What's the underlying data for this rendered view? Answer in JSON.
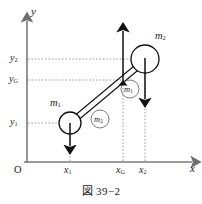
{
  "figure": {
    "caption": "図 39−2",
    "origin_label": "O",
    "axes": {
      "x_name": "x",
      "y_name": "y"
    },
    "x_ticks": [
      {
        "key": "x1",
        "base": "x",
        "sub": "1",
        "px": 70
      },
      {
        "key": "xG",
        "base": "x",
        "sub": "G",
        "px": 123
      },
      {
        "key": "x2",
        "base": "x",
        "sub": "2",
        "px": 145
      }
    ],
    "y_ticks": [
      {
        "key": "y2",
        "base": "y",
        "sub": "2",
        "px": 59
      },
      {
        "key": "yG",
        "base": "y",
        "sub": "G",
        "px": 80
      },
      {
        "key": "y1",
        "base": "y",
        "sub": "1",
        "px": 123
      }
    ],
    "masses": [
      {
        "key": "m1",
        "base": "m",
        "sub": "1",
        "label_x": 52,
        "label_y": 100,
        "cx": 70,
        "cy": 123,
        "r": 11
      },
      {
        "key": "m2",
        "base": "m",
        "sub": "2",
        "label_x": 155,
        "label_y": 36,
        "cx": 145,
        "cy": 59,
        "r": 14
      }
    ],
    "circled_labels": [
      {
        "key": "circled-m2",
        "base": "m",
        "sub": "2",
        "cx": 100,
        "cy": 119,
        "r": 9
      },
      {
        "key": "circled-m1",
        "base": "m",
        "sub": "1",
        "cx": 130,
        "cy": 89,
        "r": 9
      }
    ],
    "center_of_mass": {
      "x": 123,
      "y": 80
    },
    "force_arrows": [
      {
        "key": "weight-m1",
        "direction": "down",
        "x": 70,
        "y_from": 123,
        "y_to": 148
      },
      {
        "key": "weight-m2",
        "direction": "down",
        "x": 145,
        "y_from": 59,
        "y_to": 101
      },
      {
        "key": "normal-force",
        "direction": "up",
        "x": 123,
        "y_from": 80,
        "y_to": 29
      }
    ],
    "colors": {
      "axis": "#7b7b7b",
      "guide": "#8c8c8c",
      "stroke": "#111111",
      "fill": "#ffffff",
      "background": "#ffffff"
    }
  }
}
